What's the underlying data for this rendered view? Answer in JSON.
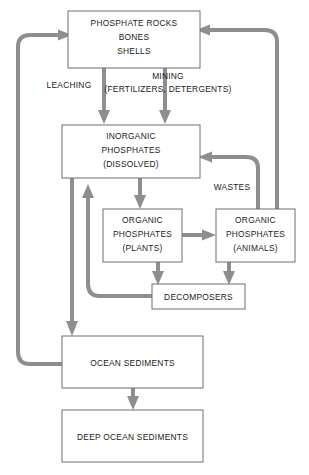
{
  "diagram": {
    "colors": {
      "box_stroke": "#6e6e6e",
      "box_fill": "#ffffff",
      "arrow": "#8e8e8e",
      "text": "#1a1a1a",
      "background": "#ffffff"
    },
    "nodes": [
      {
        "id": "phosphate-rocks",
        "lines": [
          "PHOSPHATE ROCKS",
          "BONES",
          "SHELLS"
        ]
      },
      {
        "id": "inorganic-phosphates",
        "lines": [
          "INORGANIC",
          "PHOSPHATES",
          "(DISSOLVED)"
        ]
      },
      {
        "id": "organic-phosphates-plants",
        "lines": [
          "ORGANIC",
          "PHOSPHATES",
          "(PLANTS)"
        ]
      },
      {
        "id": "organic-phosphates-animals",
        "lines": [
          "ORGANIC",
          "PHOSPHATES",
          "(ANIMALS)"
        ]
      },
      {
        "id": "decomposers",
        "lines": [
          "DECOMPOSERS"
        ]
      },
      {
        "id": "ocean-sediments",
        "lines": [
          "OCEAN SEDIMENTS"
        ]
      },
      {
        "id": "deep-ocean-sediments",
        "lines": [
          "DEEP OCEAN SEDIMENTS"
        ]
      }
    ],
    "edge_labels": [
      {
        "id": "leaching",
        "text": "LEACHING"
      },
      {
        "id": "mining",
        "line1": "MINING",
        "line2": "(FERTILIZERS, DETERGENTS)"
      },
      {
        "id": "wastes",
        "text": "WASTES"
      }
    ]
  }
}
